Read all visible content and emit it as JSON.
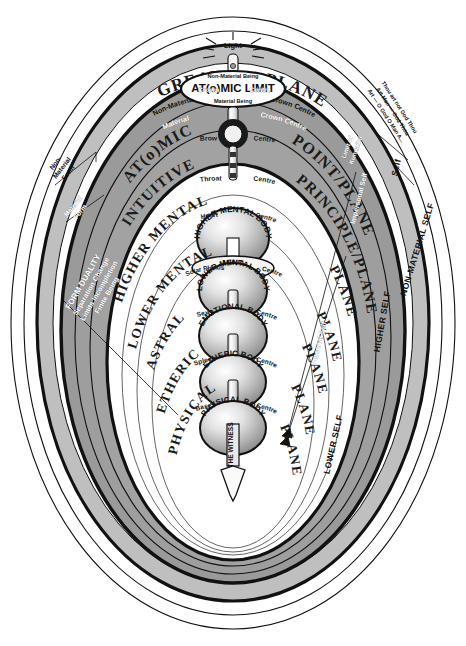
{
  "diagram": {
    "title_left": "GREAT",
    "title_right": "PLANES",
    "atomic_limit": "AT(o)MIC LIMIT",
    "light_label": "Light",
    "non_material_being": "Non-Material Being",
    "material_being": "Material Being",
    "non_material_top": "Non-Material",
    "crown_centre_top": "Crown Centre",
    "material_inner": "Material",
    "crown_centre_inner": "Crown Centre",
    "mind_bridge": "MIND\nBRIDGE",
    "mind_bridge_line1": "MIND",
    "mind_bridge_line2": "BRIDGE",
    "witness": "THE WITNESS"
  },
  "colors": {
    "band_gray": "#9a9a9a",
    "band_gray_dark": "#8e8e8e",
    "outline_black": "#111111",
    "white": "#ffffff",
    "sphere_light": "#f2f2f2",
    "sphere_mid": "#bdbdbd",
    "sphere_dark": "#8a8a8a"
  },
  "planes": [
    {
      "id": "atomic",
      "left": "AT(o)MIC",
      "right": "POINT/PLANE"
    },
    {
      "id": "intuitive",
      "left": "INTUITIVE",
      "right": "PRINCIPLE/PLANE"
    },
    {
      "id": "higher-mental",
      "left": "HIGHER MENTAL",
      "right": "PLANE"
    },
    {
      "id": "lower-mental",
      "left": "LOWER MENTAL",
      "right": "PLANE"
    },
    {
      "id": "astral",
      "left": "ASTRAL",
      "right": "PLANE"
    },
    {
      "id": "etheric",
      "left": "ETHERIC",
      "right": "PLANE"
    },
    {
      "id": "physical",
      "left": "PHYSICAL",
      "right": "PLANE"
    }
  ],
  "bodies": [
    {
      "id": "higher-mental-body",
      "label": "HIGHER MENTAL BODY"
    },
    {
      "id": "lower-mental-body",
      "label": "LOWER MENTAL BODY"
    },
    {
      "id": "emotional-body",
      "label": "EMOTIONAL BODY"
    },
    {
      "id": "etheric-body",
      "label": "ETHERIC BODY"
    },
    {
      "id": "physical-body",
      "label": "PHYSICAL BODY"
    }
  ],
  "centres": [
    {
      "id": "crown",
      "left": "Crown",
      "right": "Centre"
    },
    {
      "id": "brow",
      "left": "Brow",
      "right": "Centre"
    },
    {
      "id": "throat",
      "left": "Throat",
      "right": "Centre"
    },
    {
      "id": "heart",
      "left": "Heart",
      "right": "Centre"
    },
    {
      "id": "solar-plexus",
      "left": "Solar Plexus",
      "right": "Centre"
    },
    {
      "id": "sex",
      "left": "Sex",
      "right": "Centre"
    },
    {
      "id": "spleen",
      "left": "Spleen",
      "right": "Centre"
    },
    {
      "id": "base",
      "left": "Base",
      "right": "Centre"
    }
  ],
  "left_annotations": {
    "non_material_form_l1": "Non-",
    "non_material_form_l2": "Material",
    "non_material_form_l3": "Form",
    "material_form_l1": "Material",
    "material_form_l2": "Form",
    "form_duality_l1": "FORM DUALITY",
    "form_duality_l2": "Separation Change",
    "form_duality_l3": "Limits Incompletion",
    "form_duality_l4": "Finite Being"
  },
  "right_annotations": {
    "quote_l1": "Thou art not God Thou",
    "quote_l2": "Art Man — God Thou",
    "quote_l3": "Art — O God O Man A...",
    "self": "Self",
    "non_material_self": "NON-MATERIAL SELF",
    "higher_self": "HIGHER SELF",
    "lower_self": "LOWER SELF",
    "impersonal_self": "Impersonal Self",
    "personal_self": "Personal Self",
    "limit_of_kundalini_l1": "Limit of",
    "limit_of_kundalini_l2": "Kundalini"
  }
}
